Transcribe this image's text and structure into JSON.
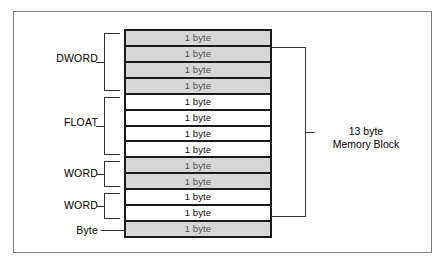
{
  "figure": {
    "cell_label": "1 byte",
    "colors": {
      "shaded_cell": "#d7d7d7",
      "plain_cell": "#ffffff",
      "cell_border": "#1a1a1a",
      "bracket": "#333333",
      "frame": "#7d7d7d",
      "text": "#000000"
    }
  },
  "memory_block": {
    "total_bytes": 13,
    "cells": [
      {
        "label": "1 byte",
        "shaded": true
      },
      {
        "label": "1 byte",
        "shaded": true
      },
      {
        "label": "1 byte",
        "shaded": true
      },
      {
        "label": "1 byte",
        "shaded": true
      },
      {
        "label": "1 byte",
        "shaded": false
      },
      {
        "label": "1 byte",
        "shaded": false
      },
      {
        "label": "1 byte",
        "shaded": false
      },
      {
        "label": "1 byte",
        "shaded": false
      },
      {
        "label": "1 byte",
        "shaded": true
      },
      {
        "label": "1 byte",
        "shaded": true
      },
      {
        "label": "1 byte",
        "shaded": false
      },
      {
        "label": "1 byte",
        "shaded": false
      },
      {
        "label": "1 byte",
        "shaded": true
      }
    ]
  },
  "left_labels": [
    {
      "name": "dword",
      "text": "DWORD",
      "bytes": 4,
      "bracket": true
    },
    {
      "name": "float",
      "text": "FLOAT",
      "bytes": 4,
      "bracket": true
    },
    {
      "name": "word-1",
      "text": "WORD",
      "bytes": 2,
      "bracket": true
    },
    {
      "name": "word-2",
      "text": "WORD",
      "bytes": 2,
      "bracket": true
    },
    {
      "name": "byte",
      "text": "Byte",
      "bytes": 1,
      "bracket": false
    }
  ],
  "right_label": {
    "line1": "13 byte",
    "line2": "Memory Block"
  }
}
